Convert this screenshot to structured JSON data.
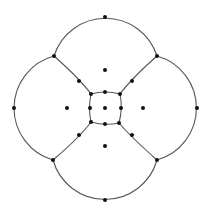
{
  "diagram": {
    "colors": {
      "edge": "#555555",
      "vertex": "#111111",
      "background": "#ffffff"
    },
    "vertices": [
      {
        "id": "top",
        "x": 105,
        "y": 17
      },
      {
        "id": "bottom",
        "x": 105,
        "y": 200
      },
      {
        "id": "left",
        "x": 14,
        "y": 108
      },
      {
        "id": "right",
        "x": 197,
        "y": 108
      },
      {
        "id": "junction-ul",
        "x": 54,
        "y": 56
      },
      {
        "id": "junction-ur",
        "x": 157,
        "y": 56
      },
      {
        "id": "junction-ll",
        "x": 53,
        "y": 160
      },
      {
        "id": "junction-lr",
        "x": 157,
        "y": 160
      },
      {
        "id": "spoke-mid-ul",
        "x": 79,
        "y": 81
      },
      {
        "id": "spoke-mid-ur",
        "x": 132,
        "y": 81
      },
      {
        "id": "spoke-mid-ll",
        "x": 79,
        "y": 135
      },
      {
        "id": "spoke-mid-lr",
        "x": 132,
        "y": 135
      },
      {
        "id": "square-tl",
        "x": 91,
        "y": 94
      },
      {
        "id": "square-tr",
        "x": 120,
        "y": 94
      },
      {
        "id": "square-bl",
        "x": 91,
        "y": 122
      },
      {
        "id": "square-br",
        "x": 119,
        "y": 123
      },
      {
        "id": "square-top",
        "x": 105,
        "y": 92
      },
      {
        "id": "square-bottom",
        "x": 105,
        "y": 124
      },
      {
        "id": "square-left",
        "x": 90,
        "y": 108
      },
      {
        "id": "square-right",
        "x": 121,
        "y": 108
      },
      {
        "id": "center",
        "x": 105,
        "y": 108
      },
      {
        "id": "face-top",
        "x": 105,
        "y": 70
      },
      {
        "id": "face-bottom",
        "x": 105,
        "y": 146
      },
      {
        "id": "face-left",
        "x": 67,
        "y": 108
      },
      {
        "id": "face-right",
        "x": 143,
        "y": 108
      }
    ],
    "arcs": [
      {
        "id": "arc-top",
        "d": "M54,56 A54,54 0 0 1 157,56"
      },
      {
        "id": "arc-right",
        "d": "M157,56 A54,54 0 0 1 157,160"
      },
      {
        "id": "arc-bottom",
        "d": "M157,160 A54,54 0 0 1 53,160"
      },
      {
        "id": "arc-left",
        "d": "M53,160 A54,54 0 0 1 54,56"
      }
    ],
    "edges": [
      {
        "id": "spoke-ul",
        "d": "M54,56 Q80,79 91,94"
      },
      {
        "id": "spoke-ur",
        "d": "M157,56 Q131,79 120,94"
      },
      {
        "id": "spoke-ll",
        "d": "M53,160 Q80,137 91,122"
      },
      {
        "id": "spoke-lr",
        "d": "M157,160 Q131,137 119,123"
      },
      {
        "id": "square-edge-top",
        "d": "M91,94 Q105,90 120,94"
      },
      {
        "id": "square-edge-right",
        "d": "M120,94 Q123,108 119,123"
      },
      {
        "id": "square-edge-bottom",
        "d": "M119,123 Q105,126 91,122"
      },
      {
        "id": "square-edge-left",
        "d": "M91,122 Q88,108 91,94"
      }
    ]
  }
}
